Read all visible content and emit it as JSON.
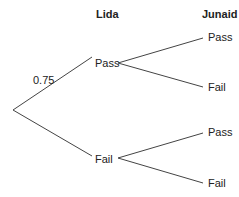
{
  "headers": {
    "first": "Lida",
    "second": "Junaid"
  },
  "probabilities": {
    "lida_pass": "0.75"
  },
  "nodes": {
    "lida_pass": "Pass",
    "lida_fail": "Fail",
    "junaid_pass_after_pass": "Pass",
    "junaid_fail_after_pass": "Fail",
    "junaid_pass_after_fail": "Pass",
    "junaid_fail_after_fail": "Fail"
  },
  "colors": {
    "line": "#444444",
    "text": "#222222"
  }
}
